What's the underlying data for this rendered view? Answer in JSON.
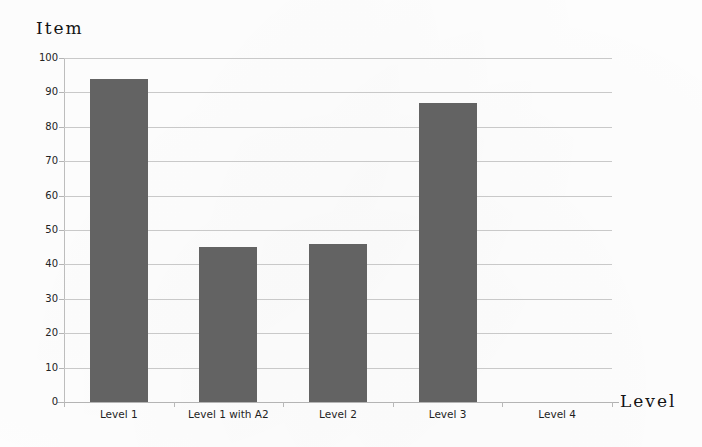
{
  "chart_data": {
    "type": "bar",
    "title": "",
    "categories": [
      "Level 1",
      "Level 1 with A2",
      "Level 2",
      "Level 3",
      "Level 4"
    ],
    "values": [
      94,
      45,
      46,
      87,
      0
    ],
    "xlabel": "Level",
    "ylabel": "Item",
    "ylim": [
      0,
      100
    ],
    "ytick_labels": [
      "100",
      "90",
      "80",
      "70",
      "60",
      "50",
      "40",
      "30",
      "20",
      "10",
      "0"
    ],
    "ytick_values": [
      100,
      90,
      80,
      70,
      60,
      50,
      40,
      30,
      20,
      10,
      0
    ],
    "ytick_step": 10,
    "grid": true,
    "grid_axis": "y",
    "legend": null,
    "legend_position": "none",
    "bar_color": "#636363",
    "grid_color": "#c9c9c9",
    "axis_color": "#b4b4b4",
    "background_color": "#fefefe"
  },
  "axis_titles": {
    "y": "Item",
    "x": "Level"
  }
}
